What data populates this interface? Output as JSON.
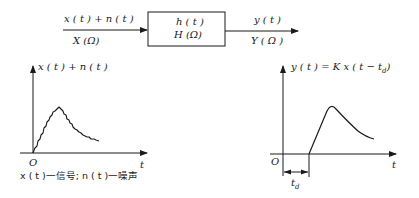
{
  "block_diagram": {
    "input_time_label": "x ( t ) + n ( t )",
    "input_freq_label": "X (Ω)",
    "system_time_label": "h ( t )",
    "system_freq_label": "H (Ω)",
    "output_time_label": "y ( t )",
    "output_freq_label": "Y ( Ω )"
  },
  "left_plot": {
    "y_axis_label": "x ( t ) + n ( t )",
    "x_axis_label": "t",
    "origin_label": "O",
    "caption": "x ( t )一信号;  n ( t )一噪声"
  },
  "right_plot": {
    "y_axis_label": "y ( t ) = K x ( t − t",
    "y_axis_label_sub": "d",
    "y_axis_label_close": ")",
    "x_axis_label": "t",
    "origin_label": "O",
    "delay_label": "t",
    "delay_label_sub": "d"
  },
  "colors": {
    "stroke": "#1a1a1a",
    "background": "#ffffff"
  }
}
